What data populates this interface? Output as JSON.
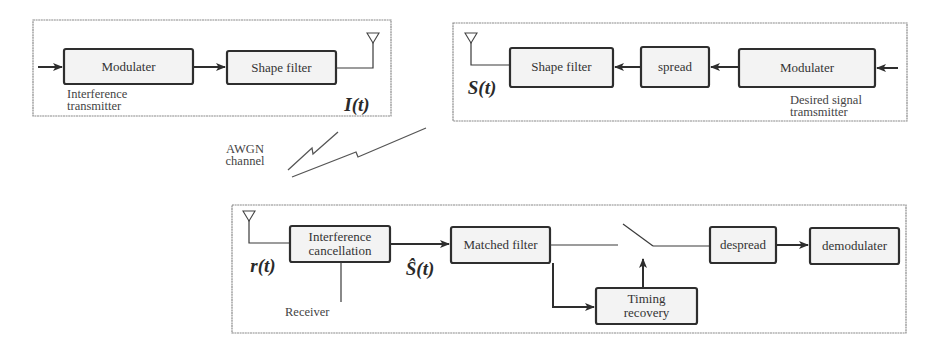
{
  "interference_transmitter": {
    "caption_line1": "Interference",
    "caption_line2": "transmitter",
    "blocks": [
      "Modulater",
      "Shape filter"
    ],
    "signal_label": "I(t)"
  },
  "desired_transmitter": {
    "caption_line1": "Desired signal",
    "caption_line2": "tramsmitter",
    "blocks": [
      "Shape filter",
      "spread",
      "Modulater"
    ],
    "signal_label": "S(t)"
  },
  "channel": {
    "label_line1": "AWGN",
    "label_line2": "channel"
  },
  "receiver": {
    "caption": "Receiver",
    "input_label": "r(t)",
    "estimate_label": "Ŝ(t)",
    "blocks": {
      "interference_line1": "Interference",
      "interference_line2": "cancellation",
      "matched_filter": "Matched filter",
      "timing_line1": "Timing",
      "timing_line2": "recovery",
      "despread": "despread",
      "demodulater": "demodulater"
    }
  }
}
